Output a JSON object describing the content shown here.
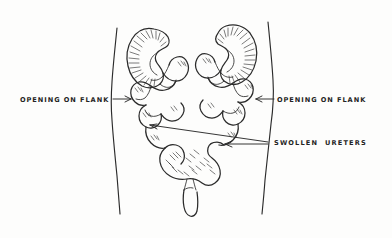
{
  "figure": {
    "background_color": "#fdfdfc",
    "ink_color": "#2b2b2b"
  },
  "labels": [
    {
      "id": "left-flank-opening",
      "text": "OPENING ON FLANK",
      "position": "left",
      "arrow": "points-right"
    },
    {
      "id": "right-flank-opening",
      "text": "OPENING ON FLANK",
      "position": "right",
      "arrow": "points-left"
    },
    {
      "id": "swollen-ureters",
      "text": "SWOLLEN  URETERS",
      "position": "right-lower",
      "arrow": "points-left"
    }
  ],
  "anatomy": {
    "left_kidney": "left-kidney",
    "right_kidney": "right-kidney",
    "left_ureter": "left-ureter",
    "right_ureter": "right-ureter",
    "bladder": "bladder",
    "urethra": "urethra",
    "torso_left": "torso-left-contour",
    "torso_right": "torso-right-contour"
  }
}
